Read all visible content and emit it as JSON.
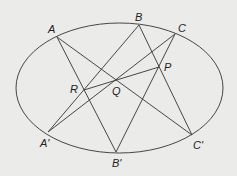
{
  "diagram": {
    "background": "#ebebea",
    "stroke_color": "#333333",
    "ellipse": {
      "cx": 119.5,
      "cy": 88,
      "rx": 103.5,
      "ry": 65
    },
    "points": {
      "A": {
        "label": "A",
        "x": 57,
        "y": 37,
        "lx": 48,
        "ly": 33
      },
      "B": {
        "label": "B",
        "x": 139,
        "y": 25,
        "lx": 135,
        "ly": 21
      },
      "C": {
        "label": "C",
        "x": 175,
        "y": 34,
        "lx": 178,
        "ly": 32
      },
      "A'": {
        "label": "A'",
        "x": 48,
        "y": 132,
        "lx": 40,
        "ly": 147
      },
      "B'": {
        "label": "B'",
        "x": 116,
        "y": 152,
        "lx": 112,
        "ly": 167
      },
      "C'": {
        "label": "C'",
        "x": 192,
        "y": 135,
        "lx": 193,
        "ly": 149
      },
      "P": {
        "label": "P",
        "x": 159,
        "y": 67,
        "lx": 164,
        "ly": 71
      },
      "Q": {
        "label": "Q",
        "x": 116,
        "y": 80,
        "lx": 112,
        "ly": 95
      },
      "R": {
        "label": "R",
        "x": 84,
        "y": 90,
        "lx": 70,
        "ly": 93
      }
    },
    "lines": [
      [
        "A",
        "B'"
      ],
      [
        "A",
        "C'"
      ],
      [
        "B",
        "A'"
      ],
      [
        "B",
        "C'"
      ],
      [
        "C",
        "A'"
      ],
      [
        "C",
        "B'"
      ],
      [
        "R",
        "P"
      ]
    ]
  }
}
